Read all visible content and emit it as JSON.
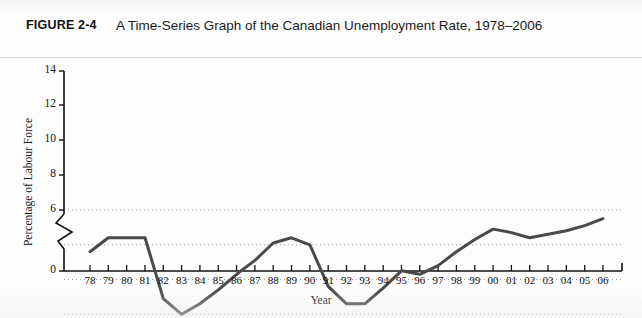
{
  "header": {
    "figure_label": "FIGURE 2-4",
    "title": "A Time-Series Graph of the Canadian Unemployment Rate, 1978–2006"
  },
  "chart_data": {
    "type": "line",
    "title": "A Time-Series Graph of the Canadian Unemployment Rate, 1978–2006",
    "xlabel": "Year",
    "ylabel": "Percentage of Labour Force",
    "categories": [
      "78",
      "79",
      "80",
      "81",
      "82",
      "83",
      "84",
      "85",
      "86",
      "87",
      "88",
      "89",
      "90",
      "91",
      "92",
      "93",
      "94",
      "95",
      "96",
      "97",
      "98",
      "99",
      "00",
      "01",
      "02",
      "03",
      "04",
      "05",
      "06"
    ],
    "values": [
      8.4,
      7.6,
      7.6,
      7.6,
      11.1,
      12.0,
      11.4,
      10.6,
      9.7,
      8.9,
      7.9,
      7.6,
      8.0,
      10.4,
      11.4,
      11.4,
      10.5,
      9.5,
      9.7,
      9.2,
      8.4,
      7.7,
      7.1,
      7.3,
      7.6,
      7.4,
      7.2,
      6.9,
      6.5
    ],
    "ylim": [
      0,
      14
    ],
    "yticks": [
      "0",
      "6",
      "8",
      "10",
      "12",
      "14"
    ],
    "axis_break": true,
    "grid": "horizontal-dotted",
    "legend": "none",
    "line_color": "#4a4a4a"
  },
  "colors": {
    "line": "#4a4a4a",
    "axis": "#111111",
    "grid": "#9a9a9a",
    "page": "#fdfdfd"
  }
}
